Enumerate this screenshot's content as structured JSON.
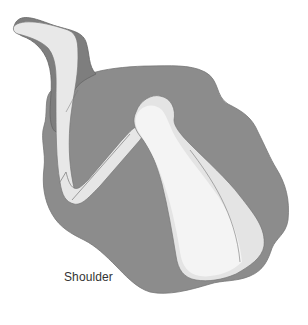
{
  "figure": {
    "label": "Shoulder",
    "colors": {
      "dark_tissue": "#8a8a8a",
      "dark_edge": "#6e6e6e",
      "light_tissue": "#e6e6e6",
      "lightest": "#f4f4f4",
      "outline": "#5a5a5a",
      "background": "#ffffff"
    }
  }
}
